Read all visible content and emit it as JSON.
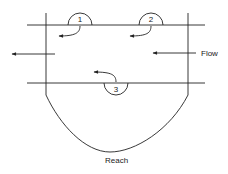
{
  "diagram": {
    "labels": {
      "flow": "Flow",
      "reach": "Reach"
    },
    "eddies": [
      {
        "id": "1",
        "label": "1",
        "position": "upper-left",
        "side": "above-top-line"
      },
      {
        "id": "2",
        "label": "2",
        "position": "upper-right",
        "side": "above-top-line"
      },
      {
        "id": "3",
        "label": "3",
        "position": "lower-center",
        "side": "below-bottom-line"
      }
    ],
    "arrows": [
      {
        "name": "flow-inflow-arrow",
        "direction": "left"
      },
      {
        "name": "flow-outflow-arrow",
        "direction": "left"
      },
      {
        "name": "eddy-1-return-arrow",
        "direction": "left"
      },
      {
        "name": "eddy-2-return-arrow",
        "direction": "left"
      },
      {
        "name": "eddy-3-return-arrow",
        "direction": "left"
      }
    ]
  }
}
